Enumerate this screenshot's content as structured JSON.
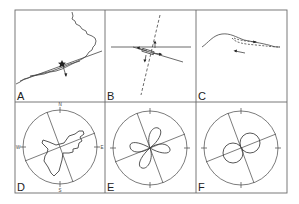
{
  "figure": {
    "stroke_color": "#444444",
    "frame_color": "#6a6a6a",
    "background": "#ffffff",
    "panels": [
      {
        "id": "A",
        "label": "A",
        "description": "coastline map with fault line and epicenter star with slip arrow"
      },
      {
        "id": "B",
        "label": "B",
        "description": "horizontal line with oblique fault trace, dashed nodal line and slip arrows"
      },
      {
        "id": "C",
        "label": "C",
        "description": "cross-section profile with dashed internal surfaces and leftward arrow"
      },
      {
        "id": "D",
        "label": "D",
        "description": "compass rose diagram with irregular star-shaped polygon",
        "compass": {
          "N": "N",
          "E": "E",
          "S": "S",
          "W": "W"
        }
      },
      {
        "id": "E",
        "label": "E",
        "description": "circle with four-lobed (quadrant) radiation pattern"
      },
      {
        "id": "F",
        "label": "F",
        "description": "circle with two-lobed radiation pattern"
      }
    ]
  }
}
